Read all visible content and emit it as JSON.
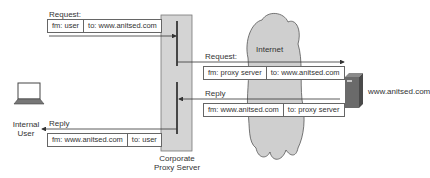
{
  "internal_user": {
    "label_line1": "Internal",
    "label_line2": "User"
  },
  "proxy": {
    "label_line1": "Corporate",
    "label_line2": "Proxy Server"
  },
  "internet": {
    "label": "Internet"
  },
  "web_server": {
    "label": "www.anitsed.com"
  },
  "messages": {
    "user_request": {
      "title": "Request:",
      "from": "fm: user",
      "to": "to: www.anitsed.com"
    },
    "proxy_request": {
      "title": "Request:",
      "from": "fm: proxy server",
      "to": "to: www.anitsed.com"
    },
    "server_reply": {
      "title": "Reply",
      "from": "fm: www.anitsed.com",
      "to": "to: proxy server"
    },
    "proxy_reply": {
      "title": "Reply",
      "from": "fm: www.anitsed.com",
      "to": "to: user"
    }
  },
  "colors": {
    "proxy_fill": "#d4d4d4",
    "cloud_fill": "#cfcfcf",
    "line": "#333333",
    "server_fill": "#6a6a6a"
  }
}
